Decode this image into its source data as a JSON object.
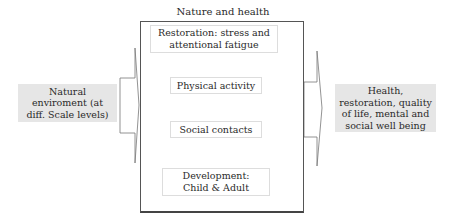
{
  "diagram": {
    "title": "Nature and health",
    "input": {
      "label": "Natural enviroment (at diff. Scale levels)"
    },
    "mediators": [
      {
        "label": "Restoration: stress and attentional fatigue"
      },
      {
        "label": "Physical activity"
      },
      {
        "label": "Social contacts"
      },
      {
        "label": "Development: Child & Adult"
      }
    ],
    "output": {
      "label": "Health, restoration, quality of life, mental and social well being"
    },
    "colors": {
      "side_box_fill": "#e6e6e6",
      "border": "#555555"
    }
  }
}
